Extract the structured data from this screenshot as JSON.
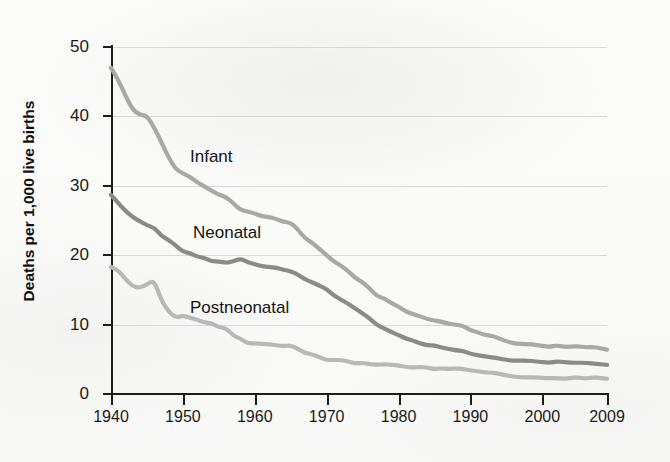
{
  "figure": {
    "background_color": "#fbfbfa",
    "plot": {
      "left": 111,
      "top": 47,
      "width": 496,
      "height": 347
    }
  },
  "chart_data": {
    "type": "line",
    "title": "",
    "xlabel": "",
    "ylabel": "Deaths per 1,000 live births",
    "xlim": [
      1940,
      2009
    ],
    "ylim": [
      0,
      50
    ],
    "grid": true,
    "legend_position": "inline-annotations",
    "x_ticks": [
      "1940",
      "1950",
      "1960",
      "1970",
      "1980",
      "1990",
      "2000",
      "2009"
    ],
    "x_tick_values": [
      1940,
      1950,
      1960,
      1970,
      1980,
      1990,
      2000,
      2009
    ],
    "y_ticks": [
      "0",
      "10",
      "20",
      "30",
      "40",
      "50"
    ],
    "y_tick_values": [
      0,
      10,
      20,
      30,
      40,
      50
    ],
    "x": [
      1940,
      1941,
      1942,
      1943,
      1944,
      1945,
      1946,
      1947,
      1948,
      1949,
      1950,
      1951,
      1952,
      1953,
      1954,
      1955,
      1956,
      1957,
      1958,
      1959,
      1960,
      1961,
      1962,
      1963,
      1964,
      1965,
      1966,
      1967,
      1968,
      1969,
      1970,
      1971,
      1972,
      1973,
      1974,
      1975,
      1976,
      1977,
      1978,
      1979,
      1980,
      1981,
      1982,
      1983,
      1984,
      1985,
      1986,
      1987,
      1988,
      1989,
      1990,
      1991,
      1992,
      1993,
      1994,
      1995,
      1996,
      1997,
      1998,
      1999,
      2000,
      2001,
      2002,
      2003,
      2004,
      2005,
      2006,
      2007,
      2008,
      2009
    ],
    "series": [
      {
        "name": "Infant",
        "color": "#a8a8a8",
        "label_text": "Infant",
        "values": [
          47.0,
          45.3,
          43.0,
          41.0,
          40.2,
          40.1,
          38.4,
          36.3,
          34.1,
          32.4,
          31.8,
          31.3,
          30.5,
          29.9,
          29.3,
          28.7,
          28.4,
          27.5,
          26.5,
          26.3,
          26.0,
          25.6,
          25.5,
          25.2,
          24.8,
          24.7,
          23.7,
          22.4,
          21.8,
          20.9,
          20.0,
          19.1,
          18.5,
          17.7,
          16.7,
          16.1,
          15.2,
          14.1,
          13.8,
          13.1,
          12.6,
          11.9,
          11.5,
          11.2,
          10.8,
          10.6,
          10.4,
          10.1,
          10.0,
          9.8,
          9.2,
          8.9,
          8.5,
          8.4,
          8.0,
          7.6,
          7.3,
          7.2,
          7.2,
          7.1,
          6.9,
          6.8,
          7.0,
          6.8,
          6.8,
          6.9,
          6.7,
          6.8,
          6.6,
          6.4
        ]
      },
      {
        "name": "Neonatal",
        "color": "#8a8a8a",
        "label_text": "Neonatal",
        "values": [
          28.7,
          27.5,
          26.4,
          25.5,
          24.9,
          24.3,
          24.0,
          22.8,
          22.2,
          21.4,
          20.5,
          20.3,
          19.8,
          19.6,
          19.1,
          19.1,
          18.9,
          19.1,
          19.5,
          19.0,
          18.7,
          18.4,
          18.3,
          18.2,
          17.9,
          17.7,
          17.2,
          16.5,
          16.1,
          15.6,
          15.1,
          14.2,
          13.6,
          13.0,
          12.3,
          11.6,
          10.9,
          9.9,
          9.5,
          8.9,
          8.5,
          8.0,
          7.7,
          7.3,
          7.0,
          7.0,
          6.7,
          6.5,
          6.3,
          6.2,
          5.8,
          5.6,
          5.4,
          5.3,
          5.1,
          4.9,
          4.8,
          4.8,
          4.8,
          4.7,
          4.6,
          4.5,
          4.7,
          4.6,
          4.5,
          4.5,
          4.5,
          4.4,
          4.3,
          4.2
        ]
      },
      {
        "name": "Postneonatal",
        "color": "#b8b8b8",
        "label_text": "Postneonatal",
        "values": [
          18.3,
          17.8,
          16.6,
          15.5,
          15.3,
          15.8,
          16.4,
          13.5,
          11.9,
          11.0,
          11.3,
          11.0,
          10.7,
          10.3,
          10.2,
          9.6,
          9.5,
          8.4,
          8.0,
          7.3,
          7.3,
          7.2,
          7.2,
          7.0,
          6.9,
          7.0,
          6.5,
          5.9,
          5.7,
          5.3,
          4.9,
          4.9,
          4.9,
          4.7,
          4.4,
          4.5,
          4.3,
          4.2,
          4.3,
          4.2,
          4.1,
          3.9,
          3.8,
          3.9,
          3.8,
          3.6,
          3.7,
          3.6,
          3.7,
          3.6,
          3.4,
          3.3,
          3.1,
          3.1,
          2.9,
          2.7,
          2.5,
          2.4,
          2.4,
          2.4,
          2.3,
          2.3,
          2.3,
          2.2,
          2.3,
          2.4,
          2.2,
          2.4,
          2.3,
          2.2
        ]
      }
    ],
    "annotations": [
      {
        "text": "Infant",
        "x": 190,
        "y": 147
      },
      {
        "text": "Neonatal",
        "x": 193,
        "y": 223
      },
      {
        "text": "Postneonatal",
        "x": 190,
        "y": 298
      }
    ]
  }
}
